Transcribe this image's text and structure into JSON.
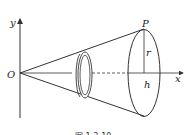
{
  "figure": {
    "labels": {
      "origin": "O",
      "y_axis": "y",
      "x_axis": "x",
      "point": "P",
      "radius": "r",
      "height": "h"
    },
    "caption": "图 1.3-10",
    "colors": {
      "stroke": "#333333",
      "background": "#ffffff"
    }
  }
}
